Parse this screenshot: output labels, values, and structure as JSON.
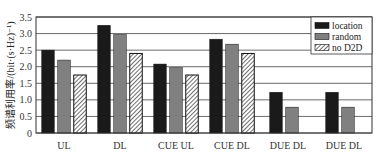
{
  "chart_data": {
    "type": "bar",
    "title": "",
    "xlabel": "",
    "ylabel": "频谱利用率/(bit·(s·Hz)⁻¹)",
    "ylim": [
      0,
      3.5
    ],
    "yticks": [
      "0",
      "0.5",
      "1.0",
      "1.5",
      "2.0",
      "2.5",
      "3.0",
      "3.5"
    ],
    "grid": "horizontal",
    "legend_position": "upper right",
    "categories": [
      "UL",
      "DL",
      "CUE UL",
      "CUE DL",
      "DUE DL",
      "DUE DL"
    ],
    "series": [
      {
        "name": "location",
        "color": "#1a1a1a",
        "pattern": "solid",
        "values": [
          2.5,
          3.25,
          2.08,
          2.83,
          1.23,
          1.23
        ]
      },
      {
        "name": "random",
        "color": "#808080",
        "pattern": "solid",
        "values": [
          2.2,
          2.97,
          1.97,
          2.68,
          0.78,
          0.78
        ]
      },
      {
        "name": "no D2D",
        "color": "#ffffff",
        "pattern": "hatch",
        "values": [
          1.75,
          2.4,
          1.75,
          2.4,
          null,
          null
        ]
      }
    ]
  }
}
